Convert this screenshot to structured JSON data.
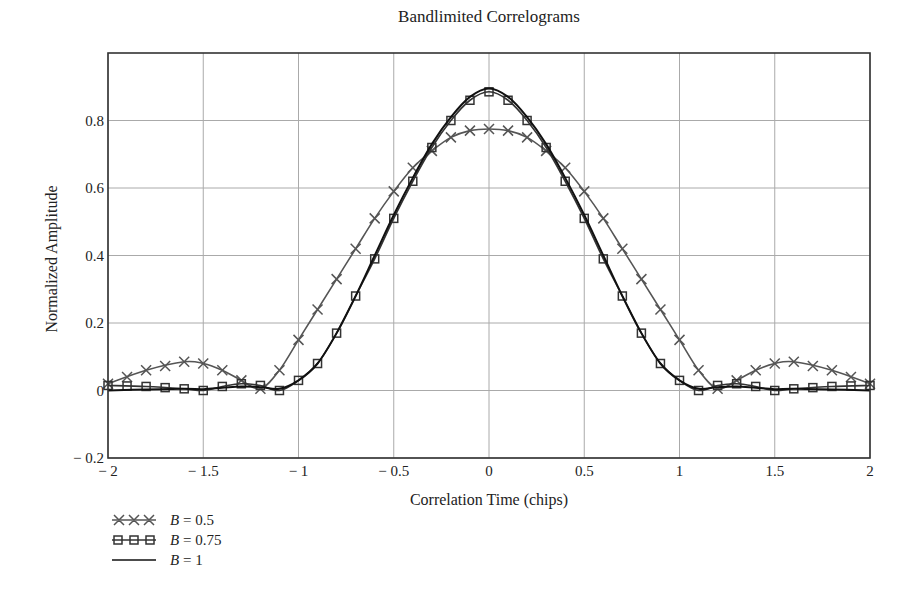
{
  "chart_data": {
    "type": "line",
    "title": "Bandlimited Correlograms",
    "xlabel": "Correlation Time (chips)",
    "ylabel": "Normalized Amplitude",
    "xlim": [
      -2,
      2
    ],
    "ylim": [
      -0.2,
      1.0
    ],
    "xticks": [
      -2,
      -1.5,
      -1,
      -0.5,
      0,
      0.5,
      1,
      1.5,
      2
    ],
    "xtick_labels": [
      "− 2",
      "− 1.5",
      "− 1",
      "− 0.5",
      "0",
      "0.5",
      "1",
      "1.5",
      "2"
    ],
    "yticks": [
      -0.2,
      0,
      0.2,
      0.4,
      0.6,
      0.8
    ],
    "ytick_labels": [
      "− 0.2",
      "0",
      "0.2",
      "0.4",
      "0.6",
      "0.8"
    ],
    "grid": true,
    "legend_position": "below-left",
    "series": [
      {
        "name": "B = 0.5",
        "marker": "x",
        "color": "#555555",
        "x": [
          -2.0,
          -1.8,
          -1.6,
          -1.5,
          -1.4,
          -1.3,
          -1.2,
          -1.1,
          -1.0,
          -0.9,
          -0.8,
          -0.7,
          -0.6,
          -0.5,
          -0.4,
          -0.3,
          -0.2,
          -0.1,
          0.0,
          0.1,
          0.2,
          0.3,
          0.4,
          0.5,
          0.6,
          0.7,
          0.8,
          0.9,
          1.0,
          1.1,
          1.2,
          1.3,
          1.4,
          1.5,
          1.6,
          1.8,
          2.0
        ],
        "values": [
          0.02,
          0.06,
          0.085,
          0.08,
          0.06,
          0.03,
          0.005,
          0.06,
          0.15,
          0.24,
          0.33,
          0.42,
          0.51,
          0.59,
          0.66,
          0.71,
          0.75,
          0.77,
          0.775,
          0.77,
          0.75,
          0.71,
          0.66,
          0.59,
          0.51,
          0.42,
          0.33,
          0.24,
          0.15,
          0.06,
          0.005,
          0.03,
          0.06,
          0.08,
          0.085,
          0.06,
          0.02
        ]
      },
      {
        "name": "B = 0.75",
        "marker": "square",
        "color": "#333333",
        "x": [
          -2.0,
          -1.8,
          -1.6,
          -1.5,
          -1.4,
          -1.3,
          -1.2,
          -1.1,
          -1.0,
          -0.9,
          -0.8,
          -0.7,
          -0.6,
          -0.5,
          -0.4,
          -0.3,
          -0.2,
          -0.1,
          0.0,
          0.1,
          0.2,
          0.3,
          0.4,
          0.5,
          0.6,
          0.7,
          0.8,
          0.9,
          1.0,
          1.1,
          1.2,
          1.3,
          1.4,
          1.5,
          1.6,
          1.8,
          2.0
        ],
        "values": [
          0.015,
          0.012,
          0.005,
          0.0,
          0.012,
          0.02,
          0.015,
          0.0,
          0.03,
          0.08,
          0.17,
          0.28,
          0.39,
          0.51,
          0.62,
          0.72,
          0.8,
          0.86,
          0.885,
          0.86,
          0.8,
          0.72,
          0.62,
          0.51,
          0.39,
          0.28,
          0.17,
          0.08,
          0.03,
          0.0,
          0.015,
          0.02,
          0.012,
          0.0,
          0.005,
          0.012,
          0.015
        ]
      },
      {
        "name": "B = 1",
        "marker": "none",
        "color": "#111111",
        "x": [
          -2.0,
          -1.8,
          -1.6,
          -1.5,
          -1.4,
          -1.3,
          -1.2,
          -1.1,
          -1.0,
          -0.9,
          -0.8,
          -0.7,
          -0.6,
          -0.5,
          -0.4,
          -0.3,
          -0.2,
          -0.1,
          0.0,
          0.1,
          0.2,
          0.3,
          0.4,
          0.5,
          0.6,
          0.7,
          0.8,
          0.9,
          1.0,
          1.1,
          1.2,
          1.3,
          1.4,
          1.5,
          1.6,
          1.8,
          2.0
        ],
        "values": [
          0.0,
          0.003,
          0.005,
          0.004,
          0.008,
          0.012,
          0.01,
          0.005,
          0.03,
          0.08,
          0.17,
          0.28,
          0.4,
          0.52,
          0.63,
          0.73,
          0.81,
          0.87,
          0.895,
          0.87,
          0.81,
          0.73,
          0.63,
          0.52,
          0.4,
          0.28,
          0.17,
          0.08,
          0.03,
          0.005,
          0.01,
          0.012,
          0.008,
          0.004,
          0.005,
          0.003,
          0.0
        ]
      }
    ]
  },
  "legend": {
    "items": [
      {
        "var": "B",
        "label": " = 0.5"
      },
      {
        "var": "B",
        "label": " = 0.75"
      },
      {
        "var": "B",
        "label": " = 1"
      }
    ]
  }
}
